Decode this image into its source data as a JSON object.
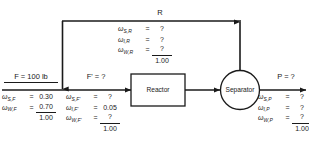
{
  "diagram": {
    "units": [
      {
        "id": "reactor",
        "label": "Reactor",
        "shape": "rectangle"
      },
      {
        "id": "separator",
        "label": "Separator",
        "shape": "circle"
      }
    ],
    "streams": {
      "feed": {
        "name": "F",
        "header": "F = 100 lb",
        "rows": [
          {
            "symbol": "ω",
            "sub": "S,F",
            "eq": "=",
            "value": "0.30"
          },
          {
            "symbol": "ω",
            "sub": "W,F",
            "eq": "=",
            "value": "0.70",
            "ruled": true
          }
        ],
        "total": "1.00"
      },
      "combined": {
        "name": "F'",
        "header": "F' = ?",
        "rows": [
          {
            "symbol": "ω",
            "sub": "S,F'",
            "eq": "=",
            "value": "?"
          },
          {
            "symbol": "ω",
            "sub": "I,F'",
            "eq": "=",
            "value": "0.05"
          },
          {
            "symbol": "ω",
            "sub": "W,F'",
            "eq": "=",
            "value": "?",
            "ruled": true
          }
        ],
        "total": "1.00"
      },
      "recycle": {
        "name": "R",
        "header": "R",
        "rows": [
          {
            "symbol": "ω",
            "sub": "S,R",
            "eq": "=",
            "value": "?"
          },
          {
            "symbol": "ω",
            "sub": "I,R",
            "eq": "=",
            "value": "?"
          },
          {
            "symbol": "ω",
            "sub": "W,R",
            "eq": "=",
            "value": "?",
            "ruled": true
          }
        ],
        "total": "1.00"
      },
      "product": {
        "name": "P",
        "header": "P = ?",
        "rows": [
          {
            "symbol": "ω",
            "sub": "S,P",
            "eq": "=",
            "value": "?"
          },
          {
            "symbol": "ω",
            "sub": "I,P",
            "eq": "=",
            "value": "?"
          },
          {
            "symbol": "ω",
            "sub": "W,P",
            "eq": "=",
            "value": "?",
            "ruled": true
          }
        ],
        "total": "1.00"
      }
    },
    "colors": {
      "line": "#1a1a1a",
      "background": "#ffffff",
      "text": "#1a1a1a"
    }
  }
}
